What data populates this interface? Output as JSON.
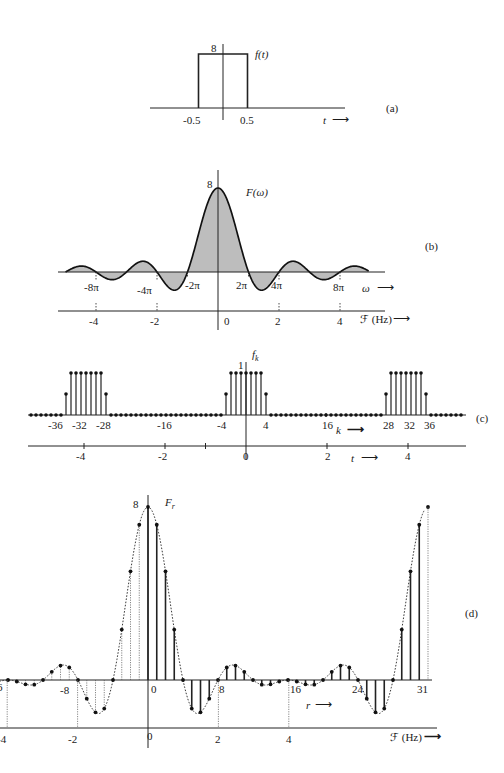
{
  "figure": {
    "panels": [
      {
        "id": "a",
        "label": "(a)",
        "function_label": "f(t)",
        "peak_label": "8",
        "ticks": [
          "-0.5",
          "0.5"
        ],
        "axis_label": "t"
      },
      {
        "id": "b",
        "label": "(b)",
        "function_label": "F(ω)",
        "peak_label": "8",
        "omega_ticks": [
          "-8π",
          "-4π",
          "-2π",
          "2π",
          "4π",
          "8π"
        ],
        "omega_axis_label": "ω",
        "freq_ticks": [
          "-4",
          "-2",
          "0",
          "2",
          "4"
        ],
        "freq_axis_label": "ℱ (Hz)"
      },
      {
        "id": "c",
        "label": "(c)",
        "function_label": "f",
        "function_subscript": "k",
        "peak_label": "1",
        "k_ticks": [
          "-36",
          "-32",
          "-28",
          "-16",
          "-4",
          "4",
          "16",
          "28",
          "32",
          "36"
        ],
        "k_axis_label": "k",
        "t_ticks": [
          "-4",
          "-2",
          "0",
          "2",
          "4"
        ],
        "t_axis_label": "t"
      },
      {
        "id": "d",
        "label": "(d)",
        "function_label": "F",
        "function_subscript": "r",
        "peak_label": "8",
        "r_ticks": [
          "-8",
          "0",
          "8",
          "16",
          "24",
          "31"
        ],
        "r_left_edge_label": "6",
        "r_axis_label": "r",
        "freq_ticks": [
          "-4",
          "-2",
          "0",
          "2",
          "4"
        ],
        "freq_axis_label": "ℱ (Hz)"
      }
    ]
  },
  "chart_data": [
    {
      "panel": "a",
      "type": "line",
      "title": "f(t)",
      "xlabel": "t",
      "x": [
        -0.5,
        -0.5,
        0.5,
        0.5
      ],
      "y": [
        0,
        8,
        8,
        0
      ],
      "ylim": [
        0,
        8
      ]
    },
    {
      "panel": "b",
      "type": "area",
      "title": "F(ω) = 8 sinc",
      "xlabel": "ω / ℱ (Hz)",
      "peak": 8,
      "zero_crossings_omega": [
        "±2π",
        "±4π",
        "±6π",
        "±8π"
      ],
      "freq_range_hz": [
        -5,
        5
      ]
    },
    {
      "panel": "c",
      "type": "stem",
      "title": "f_k",
      "xlabel": "k",
      "k_range": [
        -43,
        43
      ],
      "value_inside": 1,
      "value_edge": 0.5,
      "edges_k": [
        -4,
        4,
        -36,
        -28,
        28,
        36
      ],
      "period": 32
    },
    {
      "panel": "d",
      "type": "stem",
      "title": "F_r",
      "xlabel": "r",
      "r_range": [
        0,
        31
      ],
      "peak": 8,
      "sampling_hz_per_r": 0.25
    }
  ]
}
